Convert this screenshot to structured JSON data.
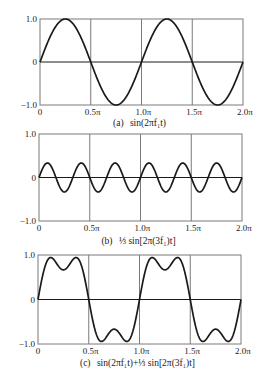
{
  "colors": {
    "frame": "#7a7a7a",
    "grid": "#7a7a7a",
    "curve": "#1a1a1a",
    "text": "#222222",
    "background": "#ffffff"
  },
  "chart_data": [
    {
      "id": "a",
      "type": "line",
      "caption_prefix": "(a)",
      "caption": "sin(2πf₁t)",
      "expression": {
        "fundamental": 1.0,
        "third_harmonic": 0.0
      },
      "xlabel": "",
      "ylabel": "",
      "x_ticks": [
        "0",
        "0.5π",
        "1.0π",
        "1.5π",
        "2.0π"
      ],
      "y_ticks": [
        "1.0",
        "0",
        "−1.0"
      ],
      "xlim": [
        0,
        6.2832
      ],
      "ylim": [
        -1.0,
        1.0
      ],
      "grid": true,
      "x_period_cycles": 2,
      "key_points": [
        {
          "x": "0",
          "y": 0
        },
        {
          "x": "0.25π",
          "y": 1.0
        },
        {
          "x": "0.5π",
          "y": 0
        },
        {
          "x": "0.75π",
          "y": -1.0
        },
        {
          "x": "1.0π",
          "y": 0
        },
        {
          "x": "1.25π",
          "y": 1.0
        },
        {
          "x": "1.5π",
          "y": 0
        },
        {
          "x": "1.75π",
          "y": -1.0
        },
        {
          "x": "2.0π",
          "y": 0
        }
      ]
    },
    {
      "id": "b",
      "type": "line",
      "caption_prefix": "(b)",
      "caption": "⅓ sin[2π(3f₁)t]",
      "expression": {
        "fundamental": 0.0,
        "third_harmonic": 0.3333
      },
      "xlabel": "",
      "ylabel": "",
      "x_ticks": [
        "0",
        "0.5π",
        "1.0π",
        "1.5π",
        "2.0π"
      ],
      "y_ticks": [
        "1.0",
        "0",
        "−1.0"
      ],
      "xlim": [
        0,
        6.2832
      ],
      "ylim": [
        -1.0,
        1.0
      ],
      "grid": true,
      "x_period_cycles": 6,
      "key_points": [
        {
          "x": "0",
          "y": 0
        },
        {
          "x": "0.0833π",
          "y": 0.333
        },
        {
          "x": "0.25π",
          "y": -0.333
        },
        {
          "x": "0.4167π",
          "y": 0.333
        },
        {
          "x": "0.5833π",
          "y": -0.333
        },
        {
          "x": "0.75π",
          "y": 0.333
        },
        {
          "x": "0.9167π",
          "y": -0.333
        },
        {
          "x": "1.0833π",
          "y": 0.333
        },
        {
          "x": "1.25π",
          "y": -0.333
        },
        {
          "x": "1.4167π",
          "y": 0.333
        },
        {
          "x": "1.5833π",
          "y": -0.333
        },
        {
          "x": "1.75π",
          "y": 0.333
        },
        {
          "x": "1.9167π",
          "y": -0.333
        },
        {
          "x": "2.0π",
          "y": 0
        }
      ]
    },
    {
      "id": "c",
      "type": "line",
      "caption_prefix": "(c)",
      "caption": "sin(2πf₁t)+⅓ sin[2π(3f₁)t]",
      "expression": {
        "fundamental": 1.0,
        "third_harmonic": 0.3333
      },
      "xlabel": "",
      "ylabel": "",
      "x_ticks": [
        "0",
        "0.5π",
        "1.0π",
        "1.5π",
        "2.0π"
      ],
      "y_ticks": [
        "1.0",
        "0",
        "−1.0"
      ],
      "xlim": [
        0,
        6.2832
      ],
      "ylim": [
        -1.0,
        1.0
      ],
      "grid": true,
      "x_period_cycles": 2,
      "key_points": [
        {
          "x": "0",
          "y": 0
        },
        {
          "x": "0.0833π",
          "y": 0.943
        },
        {
          "x": "0.25π",
          "y": 0.667
        },
        {
          "x": "0.4167π",
          "y": 0.943
        },
        {
          "x": "0.5π",
          "y": 0
        },
        {
          "x": "0.5833π",
          "y": -0.943
        },
        {
          "x": "0.75π",
          "y": -0.667
        },
        {
          "x": "0.9167π",
          "y": -0.943
        },
        {
          "x": "1.0π",
          "y": 0
        },
        {
          "x": "1.0833π",
          "y": 0.943
        },
        {
          "x": "1.25π",
          "y": 0.667
        },
        {
          "x": "1.4167π",
          "y": 0.943
        },
        {
          "x": "1.5π",
          "y": 0
        },
        {
          "x": "1.5833π",
          "y": -0.943
        },
        {
          "x": "1.75π",
          "y": -0.667
        },
        {
          "x": "1.9167π",
          "y": -0.943
        },
        {
          "x": "2.0π",
          "y": 0
        }
      ]
    }
  ]
}
